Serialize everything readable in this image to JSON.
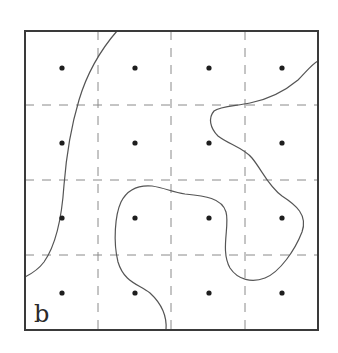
{
  "panel_label": "b",
  "colors": {
    "frame": "#3a3a3a",
    "grid": "#8a8a8a",
    "curve": "#555555",
    "dot": "#1e1e1e",
    "background": "#ffffff"
  },
  "frame": {
    "x": 25,
    "y": 31,
    "width": 293,
    "height": 299
  },
  "grid": {
    "columns_x": [
      98,
      171,
      245
    ],
    "rows_y": [
      105,
      180,
      255
    ],
    "dash": "9 8"
  },
  "dots": {
    "x": [
      62,
      135,
      209,
      282
    ],
    "y": [
      68,
      143,
      218,
      293
    ]
  },
  "curves": [
    {
      "name": "left-boundary-curve",
      "path": "M117,31 C104,46 88,70 79,100 C70,130 66,160 64,185 C62,215 56,245 44,262 C38,270 31,274 25,277"
    },
    {
      "name": "right-boundary-curve",
      "path": "M166,330 C167,318 163,305 150,293 C138,284 124,282 118,262 C113,242 115,215 121,202 C128,188 140,185 152,186 C165,188 172,192 185,194 C205,196 222,198 226,212 C230,226 220,250 230,268 C238,280 252,283 265,278 C280,272 295,250 302,232 C308,215 296,205 282,196 C268,186 262,170 252,158 C244,148 228,144 218,136 C210,128 208,118 214,111 C220,106 236,106 250,103 C270,99 286,90 298,80 C306,72 312,64 318,61"
    }
  ]
}
